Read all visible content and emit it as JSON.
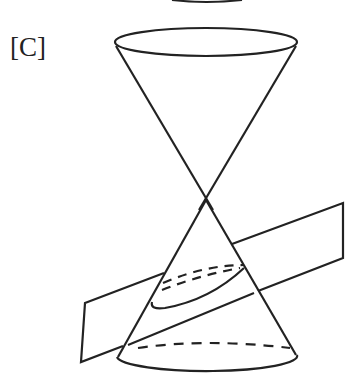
{
  "figure": {
    "label": "[C]",
    "stroke_color": "#222222"
  }
}
